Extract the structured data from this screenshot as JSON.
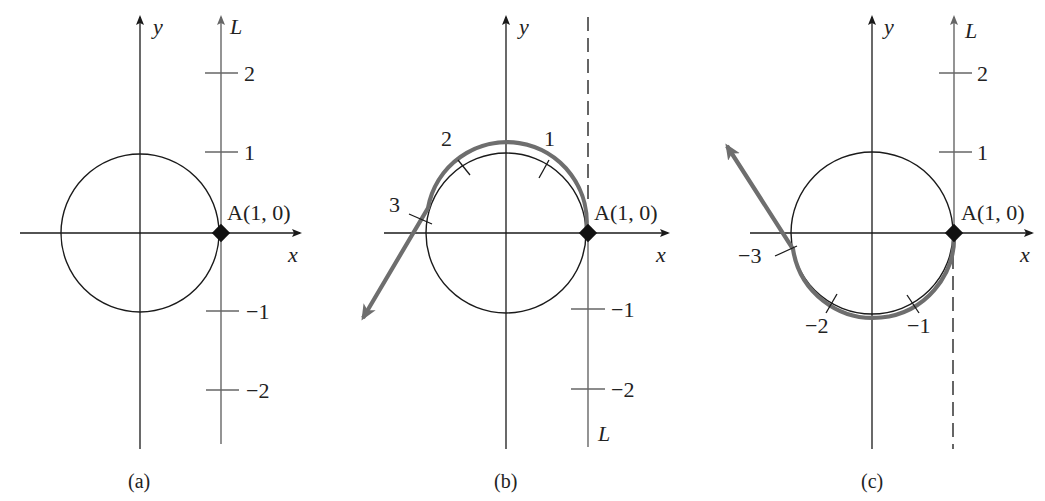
{
  "figure": {
    "colors": {
      "ink": "#1a1a1a",
      "gray_line": "#666666",
      "wrap_path": "#6e6e6e"
    },
    "panels": [
      {
        "caption": "(a)",
        "axis_x_label": "x",
        "axis_y_label": "y",
        "line_label": "L",
        "point_label": "A(1, 0)",
        "ticks": [
          "2",
          "1",
          "−1",
          "−2"
        ]
      },
      {
        "caption": "(b)",
        "axis_x_label": "x",
        "axis_y_label": "y",
        "line_label": "L",
        "point_label": "A(1, 0)",
        "ticks": [
          "−1",
          "−2"
        ],
        "wrap_ticks": [
          "1",
          "2",
          "3"
        ]
      },
      {
        "caption": "(c)",
        "axis_x_label": "x",
        "axis_y_label": "y",
        "line_label": "L",
        "point_label": "A(1, 0)",
        "ticks": [
          "2",
          "1"
        ],
        "wrap_ticks": [
          "−1",
          "−2",
          "−3"
        ]
      }
    ]
  }
}
